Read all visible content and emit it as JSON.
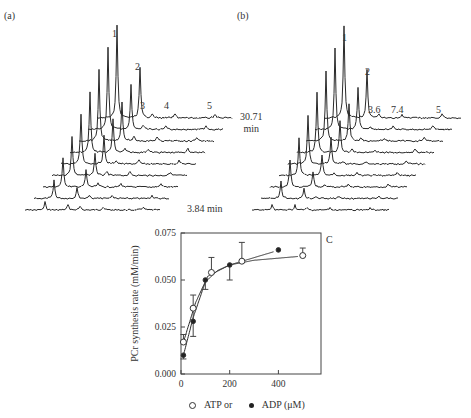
{
  "panel_a": {
    "label": "(a)",
    "peak_labels": [
      "1",
      "2",
      "3",
      "4",
      "5"
    ],
    "time_label": "3.84 min",
    "num_traces": 9
  },
  "panel_b": {
    "label": "(b)",
    "peak_labels": [
      "1",
      "2",
      "3.6",
      "7.4",
      "5"
    ],
    "time_label_line1": "30.71",
    "time_label_line2": "min",
    "num_traces": 9
  },
  "panel_c": {
    "label": "C",
    "legend_open": "ATP or",
    "legend_filled": "ADP (μM)"
  },
  "chart_data": {
    "type": "scatter",
    "title": "",
    "panel": "C",
    "xlabel": "ATP or ADP (μM)",
    "ylabel": "PCr synthesis rate (mM/min)",
    "xlim": [
      0,
      575
    ],
    "ylim": [
      0.0,
      0.075
    ],
    "xticks": [
      0,
      200,
      400
    ],
    "yticks": [
      "0.000",
      "0.025",
      "0.050",
      "0.075"
    ],
    "grid": false,
    "legend_position": "bottom",
    "series": [
      {
        "name": "ATP",
        "marker": "open-circle",
        "x": [
          10,
          50,
          125,
          250,
          500
        ],
        "y": [
          0.017,
          0.035,
          0.054,
          0.06,
          0.063
        ],
        "err_upper": [
          0.021,
          0.042,
          0.062,
          0.07,
          0.067
        ],
        "err_lower": [
          null,
          0.02,
          null,
          null,
          null
        ],
        "fit_line": "hyperbolic, plateau ~0.063"
      },
      {
        "name": "ADP",
        "marker": "filled-circle",
        "x": [
          10,
          50,
          100,
          200,
          400
        ],
        "y": [
          0.01,
          0.028,
          0.05,
          0.058,
          0.066
        ],
        "err_upper": [
          null,
          null,
          null,
          null,
          null
        ],
        "err_lower": [
          0.008,
          null,
          0.045,
          0.05,
          null
        ],
        "fit_line": "hyperbolic, rising to ~0.066"
      }
    ]
  }
}
